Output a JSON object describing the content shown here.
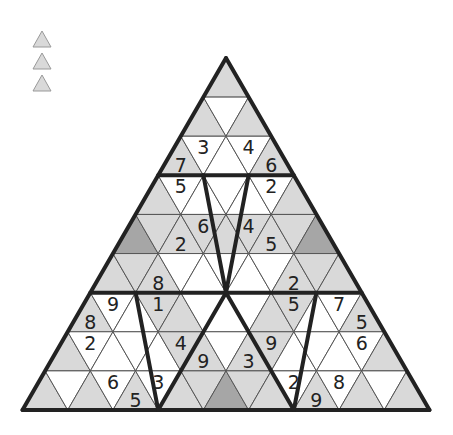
{
  "legend": {
    "items": [
      {
        "name": "legend-triangle-1",
        "fill": "#d9d9d9"
      },
      {
        "name": "legend-triangle-2",
        "fill": "#d9d9d9"
      },
      {
        "name": "legend-triangle-3",
        "fill": "#d9d9d9"
      }
    ]
  },
  "colors": {
    "white": "#ffffff",
    "gray": "#d9d9d9",
    "dark": "#a6a6a6",
    "thin_line": "#555555",
    "thick_line": "#222222"
  },
  "board": {
    "apex_x": 226,
    "apex_y": 58,
    "side": 45.22,
    "row_height": 39.11,
    "rows": 9,
    "cells": [
      [
        [
          "g",
          ""
        ]
      ],
      [
        [
          "g",
          ""
        ],
        [
          "w",
          ""
        ],
        [
          "g",
          ""
        ]
      ],
      [
        [
          "g",
          "7"
        ],
        [
          "w",
          "3"
        ],
        [
          "w",
          ""
        ],
        [
          "w",
          "4"
        ],
        [
          "g",
          "6"
        ]
      ],
      [
        [
          "g",
          ""
        ],
        [
          "w",
          "5"
        ],
        [
          "w",
          ""
        ],
        [
          "w",
          ""
        ],
        [
          "w",
          ""
        ],
        [
          "w",
          "2"
        ],
        [
          "g",
          ""
        ]
      ],
      [
        [
          "d",
          ""
        ],
        [
          "g",
          ""
        ],
        [
          "g",
          "2"
        ],
        [
          "g",
          "6"
        ],
        [
          "g",
          ""
        ],
        [
          "g",
          "4"
        ],
        [
          "g",
          "5"
        ],
        [
          "g",
          ""
        ],
        [
          "d",
          ""
        ]
      ],
      [
        [
          "g",
          ""
        ],
        [
          "g",
          ""
        ],
        [
          "g",
          "8"
        ],
        [
          "w",
          ""
        ],
        [
          "w",
          ""
        ],
        [
          "w",
          ""
        ],
        [
          "w",
          ""
        ],
        [
          "w",
          ""
        ],
        [
          "g",
          "2"
        ],
        [
          "g",
          ""
        ],
        [
          "g",
          ""
        ]
      ],
      [
        [
          "g",
          "8"
        ],
        [
          "w",
          "9"
        ],
        [
          "w",
          ""
        ],
        [
          "g",
          "1"
        ],
        [
          "g",
          ""
        ],
        [
          "w",
          ""
        ],
        [
          "w",
          ""
        ],
        [
          "w",
          ""
        ],
        [
          "g",
          ""
        ],
        [
          "g",
          "5"
        ],
        [
          "w",
          ""
        ],
        [
          "w",
          "7"
        ],
        [
          "g",
          "5"
        ]
      ],
      [
        [
          "g",
          ""
        ],
        [
          "w",
          "2"
        ],
        [
          "w",
          ""
        ],
        [
          "w",
          ""
        ],
        [
          "w",
          ""
        ],
        [
          "g",
          "4"
        ],
        [
          "g",
          "9"
        ],
        [
          "w",
          ""
        ],
        [
          "g",
          "3"
        ],
        [
          "g",
          "9"
        ],
        [
          "w",
          ""
        ],
        [
          "w",
          ""
        ],
        [
          "w",
          ""
        ],
        [
          "w",
          "6"
        ],
        [
          "g",
          ""
        ]
      ],
      [
        [
          "g",
          ""
        ],
        [
          "w",
          ""
        ],
        [
          "g",
          ""
        ],
        [
          "w",
          "6"
        ],
        [
          "g",
          "5"
        ],
        [
          "w",
          "3"
        ],
        [
          "g",
          ""
        ],
        [
          "g",
          ""
        ],
        [
          "d",
          ""
        ],
        [
          "g",
          ""
        ],
        [
          "g",
          ""
        ],
        [
          "w",
          "2"
        ],
        [
          "g",
          "9"
        ],
        [
          "w",
          "8"
        ],
        [
          "g",
          ""
        ],
        [
          "w",
          ""
        ],
        [
          "g",
          ""
        ]
      ]
    ],
    "thick_segments": [
      [
        [
          0,
          0
        ],
        [
          9,
          0
        ]
      ],
      [
        [
          0,
          0
        ],
        [
          9,
          9
        ]
      ],
      [
        [
          9,
          0
        ],
        [
          9,
          9
        ]
      ],
      [
        [
          3,
          0
        ],
        [
          3,
          3
        ]
      ],
      [
        [
          6,
          0
        ],
        [
          6,
          6
        ]
      ],
      [
        [
          3,
          1
        ],
        [
          6,
          3
        ]
      ],
      [
        [
          3,
          2
        ],
        [
          6,
          3
        ]
      ],
      [
        [
          6,
          1
        ],
        [
          9,
          3
        ]
      ],
      [
        [
          6,
          3
        ],
        [
          9,
          3
        ]
      ],
      [
        [
          6,
          3
        ],
        [
          9,
          6
        ]
      ],
      [
        [
          6,
          5
        ],
        [
          9,
          6
        ]
      ]
    ]
  }
}
